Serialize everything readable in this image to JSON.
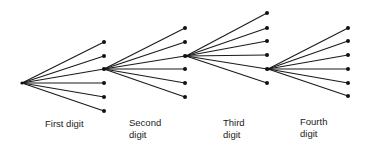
{
  "diagram": {
    "type": "tree",
    "line_color": "#1a1a1a",
    "node_color": "#111111",
    "stages": [
      {
        "label": "First digit",
        "origin": [
          22,
          83
        ],
        "leaf_x": 104,
        "leaf_y": [
          42,
          56,
          69,
          83,
          97,
          111
        ],
        "expanded_leaf_index": 2
      },
      {
        "label": "Second\ndigit",
        "origin": [
          104,
          69
        ],
        "leaf_x": 185,
        "leaf_y": [
          28,
          42,
          56,
          69,
          83,
          97
        ],
        "expanded_leaf_index": 2
      },
      {
        "label": "Third\ndigit",
        "origin": [
          186,
          56
        ],
        "leaf_x": 267,
        "leaf_y": [
          13,
          28,
          41,
          55,
          69,
          83
        ],
        "expanded_leaf_index": 4
      },
      {
        "label": "Fourth\ndigit",
        "origin": [
          268,
          69
        ],
        "leaf_x": 348,
        "leaf_y": [
          28,
          41,
          55,
          69,
          83,
          96
        ],
        "expanded_leaf_index": null
      }
    ]
  },
  "labels": {
    "first": "First digit",
    "second": "Second\ndigit",
    "third": "Third\ndigit",
    "fourth": "Fourth\ndigit"
  }
}
